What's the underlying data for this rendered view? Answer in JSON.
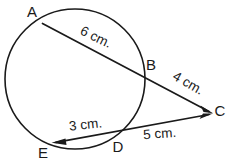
{
  "figure": {
    "type": "geometry-diagram",
    "background_color": "#ffffff",
    "stroke_color": "#1a1a1a",
    "circle": {
      "cx": 75,
      "cy": 79,
      "r": 70
    },
    "points": [
      {
        "id": "A",
        "label": "A",
        "x": 42.5,
        "y": 23.5,
        "label_x": 32,
        "label_y": 17
      },
      {
        "id": "B",
        "label": "B",
        "x": 140.5,
        "y": 72.0,
        "label_x": 151,
        "label_y": 70
      },
      {
        "id": "C",
        "label": "C",
        "x": 212.0,
        "y": 113.0,
        "label_x": 220,
        "label_y": 116
      },
      {
        "id": "D",
        "label": "D",
        "x": 118.0,
        "y": 136.5,
        "label_x": 118,
        "label_y": 152
      },
      {
        "id": "E",
        "label": "E",
        "x": 52.0,
        "y": 143.0,
        "label_x": 43,
        "label_y": 158
      }
    ],
    "segments": [
      {
        "id": "AC",
        "from": "A",
        "to": "C",
        "label": "6 cm.",
        "sublabel": "AB"
      },
      {
        "id": "BC",
        "from": "B",
        "to": "C",
        "label": "4 cm.",
        "sublabel": "BC"
      },
      {
        "id": "EC",
        "from": "E",
        "to": "C",
        "label": "3 cm.",
        "sublabel": "ED"
      },
      {
        "id": "DC",
        "from": "D",
        "to": "C",
        "label": "5 cm.",
        "sublabel": "DC"
      }
    ],
    "measurements": [
      {
        "id": "len-6",
        "text": "6 cm.",
        "x": 94,
        "y": 41,
        "rotation": 26
      },
      {
        "id": "len-4",
        "text": "4 cm.",
        "x": 186,
        "y": 87,
        "rotation": 30
      },
      {
        "id": "len-3",
        "text": "3 cm.",
        "x": 86,
        "y": 129,
        "rotation": -6
      },
      {
        "id": "len-5",
        "text": "5 cm.",
        "x": 160,
        "y": 138,
        "rotation": -4
      }
    ]
  }
}
